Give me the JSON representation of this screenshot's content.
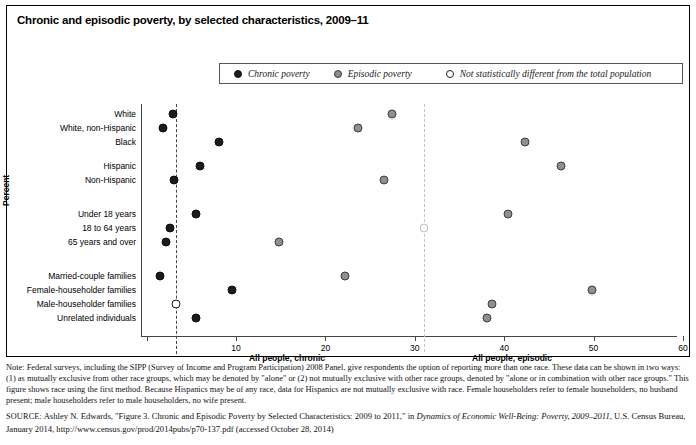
{
  "figure": {
    "title": "Chronic and episodic poverty, by selected characteristics, 2009–11",
    "y_axis_label": "Percent"
  },
  "legend": {
    "items": [
      {
        "label": "Chronic poverty",
        "marker": "chronic-dot-icon",
        "color": "#1c1c1c"
      },
      {
        "label": "Episodic poverty",
        "marker": "episodic-dot-icon",
        "color": "#8f8f8f"
      },
      {
        "label": "Not statistically different from the total population",
        "marker": "open-dot-icon",
        "color": "#ffffff"
      }
    ]
  },
  "axis_notes": {
    "chronic": "All people, chronic",
    "episodic": "All people, episodic"
  },
  "notes": {
    "text": "Note: Federal surveys, including the SIPP (Survey of Income and Program Participation) 2008 Panel, give respondents the option of reporting more than one race. These data can be shown in two ways: (1) as mutually exclusive from other race groups, which may be denoted by \"alone\" or (2) not mutually exclusive with other race groups, denoted by \"alone or in combination with other race groups.\" This figure shows race using the first method. Because Hispanics may be of any race, data for Hispanics are not mutually exclusive with race. Female householders refer to female householders, no husband present; male householders refer to male householders, no wife present."
  },
  "source": {
    "label": "SOURCE:",
    "text_before_italic": " Ashley N. Edwards, \"Figure 3. Chronic and Episodic Poverty by Selected Characteristics: 2009 to 2011,\" in ",
    "italic_1": "Dynamics of Economic Well-Being: Poverty, 2009–2011",
    "text_after": ", U.S. Census Bureau, January 2014, http://www.census.gov/prod/2014pubs/p70-137.pdf (accessed October 28, 2014)"
  },
  "chart_data": {
    "type": "scatter",
    "title": "Chronic and episodic poverty, by selected characteristics, 2009–11",
    "xlabel": "Percent",
    "ylabel": "",
    "xlim": [
      0,
      60
    ],
    "xticks": [
      0,
      10,
      20,
      30,
      40,
      50,
      60
    ],
    "xtick_labels": [
      "",
      "10",
      "20",
      "30",
      "40",
      "50",
      "60"
    ],
    "grid": false,
    "legend_position": "top",
    "reference_lines": [
      {
        "name": "All people, chronic",
        "value": 3.3,
        "style": "dashed",
        "color": "#444444"
      },
      {
        "name": "All people, episodic",
        "value": 31.0,
        "style": "dashed",
        "color": "#c3c3c3"
      }
    ],
    "categories": [
      "White",
      "White, non-Hispanic",
      "Black",
      "Hispanic",
      "Non-Hispanic",
      "Under 18 years",
      "18 to 64 years",
      "65 years and over",
      "Married-couple families",
      "Female-householder families",
      "Male-householder families",
      "Unrelated individuals"
    ],
    "series": [
      {
        "name": "Chronic poverty",
        "color": "#1c1c1c",
        "values": [
          3.0,
          1.8,
          8.1,
          6.0,
          3.1,
          5.5,
          2.6,
          2.2,
          1.5,
          9.6,
          3.3,
          5.5
        ],
        "not_significant": [
          false,
          false,
          false,
          false,
          false,
          false,
          false,
          false,
          false,
          false,
          true,
          false
        ]
      },
      {
        "name": "Episodic poverty",
        "color": "#8f8f8f",
        "values": [
          27.4,
          23.6,
          42.3,
          46.3,
          26.6,
          40.4,
          31.0,
          14.8,
          22.2,
          49.8,
          38.6,
          38.1
        ],
        "not_significant": [
          false,
          false,
          false,
          false,
          false,
          false,
          true,
          false,
          false,
          false,
          false,
          false
        ]
      }
    ]
  }
}
